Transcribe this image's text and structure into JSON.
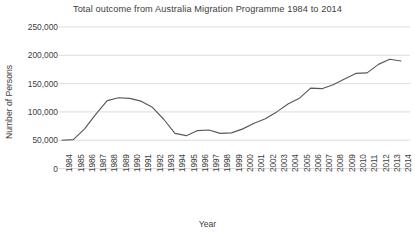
{
  "chart_data": {
    "type": "line",
    "title": "Total outcome from Australia Migration Programme 1984 to 2014",
    "xlabel": "Year",
    "ylabel": "Number of Persons",
    "ylim": [
      0,
      250000
    ],
    "yticks": [
      0,
      50000,
      100000,
      150000,
      200000,
      250000
    ],
    "ytick_labels": [
      "0",
      "50,000",
      "100,000",
      "150,000",
      "200,000",
      "250,000"
    ],
    "grid": "horizontal",
    "legend": "none",
    "line_color": "#595959",
    "categories": [
      "1984",
      "1985",
      "1986",
      "1987",
      "1988",
      "1989",
      "1990",
      "1991",
      "1992",
      "1993",
      "1994",
      "1995",
      "1996",
      "1997",
      "1998",
      "1999",
      "2000",
      "2001",
      "2002",
      "2003",
      "2004",
      "2005",
      "2006",
      "2007",
      "2008",
      "2009",
      "2010",
      "2011",
      "2012",
      "2013",
      "2014"
    ],
    "values": [
      50000,
      51000,
      70000,
      96000,
      120000,
      125000,
      124000,
      119000,
      108000,
      87000,
      62000,
      58000,
      67000,
      68000,
      62000,
      63000,
      70000,
      80000,
      88000,
      100000,
      114000,
      124000,
      142000,
      141000,
      148000,
      158000,
      168000,
      169000,
      184000,
      193000,
      190000
    ],
    "xtick_count": 31
  }
}
